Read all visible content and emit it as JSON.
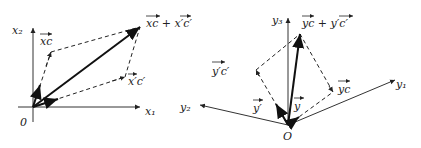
{
  "left_diagram": {
    "axis_x1_label": "x₁",
    "axis_x2_label": "x₂",
    "origin_label": "0",
    "vector_xc_label": "xc",
    "vector_xpcp_label": "x′c′",
    "sum_label": "xc + x′c′"
  },
  "right_diagram": {
    "axis_y1_label": "y₁",
    "axis_y2_label": "y₂",
    "axis_y3_label": "y₃",
    "origin_label": "O",
    "vector_yc_label": "yc",
    "vector_ypcp_label": "y′c′",
    "vector_y_label": "y",
    "vector_yp_label": "y′",
    "sum_label": "yc + y′c′"
  }
}
